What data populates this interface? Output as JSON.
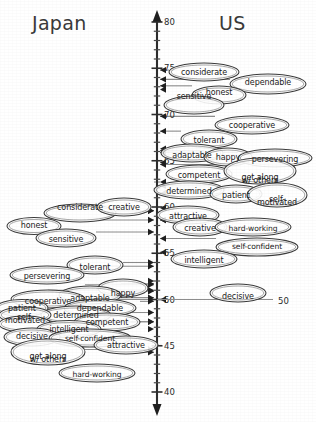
{
  "figure": {
    "header_left": "Japan",
    "header_right": "US",
    "axis": {
      "orientation": "vertical",
      "top_value": 80,
      "bottom_value": 40,
      "major_labels": [
        "80",
        "75",
        "70",
        "65",
        "60",
        "55",
        "50",
        "45",
        "40"
      ],
      "major_values": [
        80,
        75,
        70,
        65,
        60,
        55,
        50,
        45,
        40
      ],
      "minor_tick_step": 1,
      "label_50": "50"
    }
  },
  "chart_data": {
    "type": "scatter",
    "xlabel": "",
    "ylabel": "",
    "ylim": [
      40,
      80
    ],
    "grid": false,
    "legend": "none",
    "axis_ticks": [
      80,
      75,
      70,
      65,
      60,
      55,
      50,
      45,
      40
    ],
    "series": [
      {
        "name": "Japan",
        "side": "left",
        "categories": [
          "considerate",
          "creative",
          "honest",
          "sensitive",
          "tolerant",
          "persevering",
          "cooperative",
          "adaptable",
          "happy",
          "patient",
          "dependable",
          "self-motivated",
          "determined",
          "competent",
          "intelligent",
          "decisive",
          "self-confident",
          "attractive",
          "get along w/ others",
          "hard-working"
        ],
        "values": [
          59.6,
          59.6,
          58.6,
          57.3,
          54.0,
          53.6,
          51.6,
          51.6,
          52.0,
          51.0,
          50.9,
          50.0,
          50.2,
          49.8,
          48.6,
          47.6,
          47.6,
          46.8,
          44.5,
          44.5
        ]
      },
      {
        "name": "US",
        "side": "right",
        "categories": [
          "considerate",
          "dependable",
          "honest",
          "sensitive",
          "cooperative",
          "tolerant",
          "adaptable",
          "happy",
          "persevering",
          "competent",
          "get along w/ others",
          "determined",
          "patient",
          "self-motivated",
          "attractive",
          "creative",
          "hard-working",
          "self-confident",
          "intelligent",
          "decisive"
        ],
        "values": [
          74.8,
          73.8,
          73.1,
          72.7,
          69.8,
          68.2,
          66.3,
          66.1,
          65.9,
          64.8,
          64.6,
          62.7,
          62.3,
          61.5,
          59.9,
          58.6,
          58.6,
          56.6,
          55.1,
          50.0
        ]
      }
    ]
  },
  "japan_items": [
    {
      "label": "considerate",
      "value": 59.6,
      "cx": 80,
      "cy": 213,
      "rx": 36,
      "ry": 9,
      "y": 205
    },
    {
      "label": "creative",
      "value": 59.6,
      "cx": 124,
      "cy": 207,
      "rx": 27,
      "ry": 9,
      "y": 205
    },
    {
      "label": "honest",
      "value": 58.6,
      "cx": 34,
      "cy": 226,
      "rx": 27,
      "ry": 8.5,
      "y": 223
    },
    {
      "label": "sensitive",
      "value": 57.3,
      "cx": 66,
      "cy": 238,
      "rx": 30,
      "ry": 9,
      "y": 237
    },
    {
      "label": "tolerant",
      "value": 54.0,
      "cx": 95,
      "cy": 265,
      "rx": 28,
      "ry": 9,
      "y": 265
    },
    {
      "label": "persevering",
      "value": 53.6,
      "cx": 47,
      "cy": 275,
      "rx": 37,
      "ry": 9,
      "y": 274
    },
    {
      "label": "happy",
      "value": 52.0,
      "cx": 123,
      "cy": 288,
      "rx": 25,
      "ry": 9,
      "y": 291
    },
    {
      "label": "adaptable",
      "value": 51.7,
      "cx": 90,
      "cy": 295,
      "rx": 31,
      "ry": 9,
      "y": 296
    },
    {
      "label": "cooperative",
      "value": 51.6,
      "cx": 48,
      "cy": 299,
      "rx": 37,
      "ry": 9,
      "y": 299
    },
    {
      "label": "dependable",
      "value": 50.9,
      "cx": 100,
      "cy": 308,
      "rx": 36,
      "ry": 9,
      "y": 306
    },
    {
      "label": "patient",
      "value": 51.0,
      "cx": 22,
      "cy": 308,
      "rx": 26,
      "ry": 8.5,
      "y": 306
    },
    {
      "label": "determined",
      "value": 50.2,
      "cx": 76,
      "cy": 315,
      "rx": 35,
      "ry": 9,
      "y": 313
    },
    {
      "label": "self-",
      "value": 50.0,
      "cx": 25,
      "cy": 315,
      "rx": 26,
      "ry": 8,
      "y": 315
    },
    {
      "label": "motivated",
      "value": 50.0,
      "cx": 25,
      "cy": 324,
      "rx": 26,
      "ry": 8,
      "y": 318
    },
    {
      "label": "competent",
      "value": 49.8,
      "cx": 107,
      "cy": 322,
      "rx": 33,
      "ry": 9,
      "y": 320
    },
    {
      "label": "intelligent",
      "value": 48.6,
      "cx": 69,
      "cy": 329,
      "rx": 32,
      "ry": 8.5,
      "y": 327
    },
    {
      "label": "decisive",
      "value": 47.6,
      "cx": 32,
      "cy": 337,
      "rx": 28,
      "ry": 9,
      "y": 334
    },
    {
      "label": "self-confident",
      "value": 47.6,
      "cx": 90,
      "cy": 338,
      "rx": 41,
      "ry": 9,
      "y": 336
    },
    {
      "label": "attractive",
      "value": 46.8,
      "cx": 126,
      "cy": 345,
      "rx": 32,
      "ry": 9,
      "y": 343
    },
    {
      "label": "get along",
      "value": 44.6,
      "cx": 48,
      "cy": 352,
      "rx": 37,
      "ry": 13,
      "y": 354
    },
    {
      "label": "w/ others",
      "value": 44.6,
      "cx": 48,
      "cy": 361,
      "rx": 37,
      "ry": 13,
      "y": 357
    },
    {
      "label": "hard-working",
      "value": 44.3,
      "cx": 97,
      "cy": 373,
      "rx": 38,
      "ry": 9,
      "y": 372
    }
  ],
  "us_items": [
    {
      "label": "considerate",
      "value": 74.8,
      "cx": 204,
      "cy": 72,
      "rx": 35,
      "ry": 9,
      "y": 70
    },
    {
      "label": "dependable",
      "value": 73.8,
      "cx": 268,
      "cy": 84,
      "rx": 38,
      "ry": 10,
      "y": 80
    },
    {
      "label": "honest",
      "value": 73.1,
      "cx": 219,
      "cy": 95,
      "rx": 27,
      "ry": 9,
      "y": 90
    },
    {
      "label": "sensitive",
      "value": 72.7,
      "cx": 194,
      "cy": 105,
      "rx": 30,
      "ry": 9,
      "y": 94
    },
    {
      "label": "cooperative",
      "value": 69.8,
      "cx": 252,
      "cy": 125,
      "rx": 37,
      "ry": 9,
      "y": 123
    },
    {
      "label": "tolerant",
      "value": 68.2,
      "cx": 209,
      "cy": 139,
      "rx": 28,
      "ry": 9,
      "y": 138
    },
    {
      "label": "adaptable",
      "value": 66.3,
      "cx": 192,
      "cy": 153,
      "rx": 31,
      "ry": 9,
      "y": 153
    },
    {
      "label": "happy",
      "value": 66.1,
      "cx": 228,
      "cy": 157,
      "rx": 24,
      "ry": 9,
      "y": 155
    },
    {
      "label": "persevering",
      "value": 65.9,
      "cx": 275,
      "cy": 158,
      "rx": 37,
      "ry": 9,
      "y": 157
    },
    {
      "label": "competent",
      "value": 64.8,
      "cx": 199,
      "cy": 174,
      "rx": 33,
      "ry": 9,
      "y": 173
    },
    {
      "label": "get along",
      "value": 64.6,
      "cx": 260,
      "cy": 171,
      "rx": 36,
      "ry": 13,
      "y": 175
    },
    {
      "label": "w/ others",
      "value": 64.6,
      "cx": 260,
      "cy": 180,
      "rx": 36,
      "ry": 13,
      "y": 178
    },
    {
      "label": "determined",
      "value": 62.7,
      "cx": 189,
      "cy": 190,
      "rx": 35,
      "ry": 9,
      "y": 189
    },
    {
      "label": "patient",
      "value": 62.3,
      "cx": 236,
      "cy": 194,
      "rx": 26,
      "ry": 9,
      "y": 193
    },
    {
      "label": "self-",
      "value": 61.5,
      "cx": 277,
      "cy": 195,
      "rx": 30,
      "ry": 12,
      "y": 197
    },
    {
      "label": "motivated",
      "value": 61.5,
      "cx": 277,
      "cy": 204,
      "rx": 30,
      "ry": 12,
      "y": 200
    },
    {
      "label": "attractive",
      "value": 59.9,
      "cx": 188,
      "cy": 215,
      "rx": 31,
      "ry": 9,
      "y": 214
    },
    {
      "label": "creative",
      "value": 58.6,
      "cx": 200,
      "cy": 227,
      "rx": 27,
      "ry": 9,
      "y": 226
    },
    {
      "label": "hard-working",
      "value": 58.6,
      "cx": 253,
      "cy": 227,
      "rx": 38,
      "ry": 9,
      "y": 226
    },
    {
      "label": "self-confident",
      "value": 56.6,
      "cx": 257,
      "cy": 247,
      "rx": 41,
      "ry": 9,
      "y": 244
    },
    {
      "label": "intelligent",
      "value": 55.1,
      "cx": 204,
      "cy": 259,
      "rx": 33,
      "ry": 9,
      "y": 258
    },
    {
      "label": "decisive",
      "value": 50.0,
      "cx": 238,
      "cy": 293,
      "rx": 28,
      "ry": 9,
      "y": 294
    }
  ]
}
